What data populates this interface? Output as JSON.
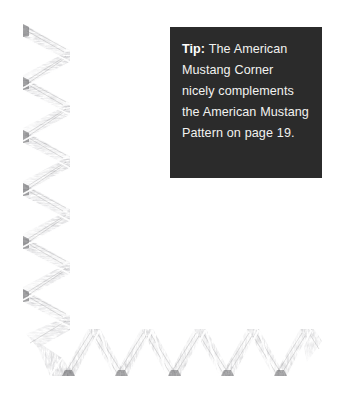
{
  "page": {
    "background_color": "#ffffff",
    "width": 338,
    "height": 408
  },
  "artwork": {
    "name": "american-mustang-corner-pencil-drawing",
    "description": "Hand-drawn pencil-shaded zigzag chevron ribbon forming an L-shaped corner border along the left and bottom edges",
    "technique": "graphite pencil shading",
    "stroke_color": "#6e6e70",
    "shade_color": "#9a9a9c",
    "highlight_color": "#ffffff",
    "vertical_band": {
      "x": 22,
      "y": 22,
      "width": 50,
      "height": 310,
      "chevron_period": 53,
      "chevron_direction": "right"
    },
    "horizontal_band": {
      "x": 60,
      "y": 327,
      "width": 260,
      "height": 50,
      "chevron_period": 53,
      "chevron_direction": "up"
    }
  },
  "tip": {
    "box_color": "#2b2b2b",
    "text_color": "#f2f2f0",
    "label": "Tip:",
    "body": " The American Mustang Corner nicely complements the American Mustang Pattern on page 19.",
    "lines": [
      "Tip: The American",
      "Mustang Corner",
      "nicely complements",
      "the American",
      "Mustang Pattern on",
      "page 19."
    ],
    "page_reference": "19"
  }
}
